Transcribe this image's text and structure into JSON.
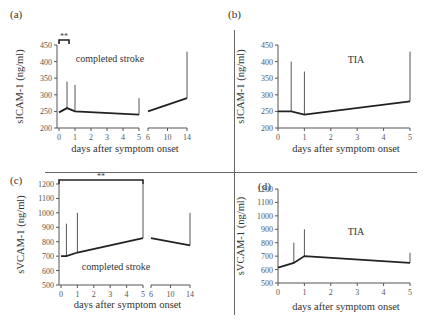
{
  "figure": {
    "panels": [
      "a",
      "b",
      "c",
      "d"
    ],
    "divider_color": "#666666",
    "line_color": "#222222",
    "axis_color": "#555555"
  },
  "chart_data": [
    {
      "panel": "(a)",
      "type": "line",
      "title": "",
      "annotation": "completed stroke",
      "significance_marker": "**",
      "significance_span": [
        0,
        0.5
      ],
      "xlabel": "days after symptom onset",
      "ylabel": "sICAM-1 (ng/ml)",
      "ylim": [
        200,
        450
      ],
      "yticks": [
        200,
        250,
        300,
        350,
        400,
        450
      ],
      "x_segments": [
        {
          "xticks": [
            0,
            1,
            2,
            3,
            4,
            5
          ],
          "range": [
            0,
            5
          ]
        },
        {
          "xticks": [
            6,
            10,
            14
          ],
          "range": [
            6,
            14
          ]
        }
      ],
      "xtick_labels": [
        "0",
        "1",
        "2",
        "3",
        "4",
        "5",
        "6",
        "10",
        "14"
      ],
      "series": [
        {
          "name": "mean",
          "x": [
            0,
            0.5,
            1,
            5
          ],
          "values": [
            247,
            260,
            250,
            240
          ]
        },
        {
          "name": "mean (late)",
          "x": [
            6,
            14
          ],
          "values": [
            250,
            290
          ]
        }
      ],
      "error_bars": [
        {
          "x": 0.5,
          "mean": 260,
          "upper": 340
        },
        {
          "x": 1,
          "mean": 250,
          "upper": 330
        },
        {
          "x": 5,
          "mean": 240,
          "upper": 290
        },
        {
          "x": 14,
          "mean": 290,
          "upper": 430
        }
      ],
      "grid": false
    },
    {
      "panel": "(b)",
      "type": "line",
      "annotation": "TIA",
      "xlabel": "days after symptom onset",
      "ylabel": "sICAM-1 (ng/ml)",
      "ylim": [
        200,
        450
      ],
      "yticks": [
        200,
        250,
        300,
        350,
        400,
        450
      ],
      "xlim": [
        0,
        5
      ],
      "xtick_labels": [
        "0",
        "1",
        "2",
        "3",
        "4",
        "5"
      ],
      "series": [
        {
          "name": "mean",
          "x": [
            0,
            0.5,
            1,
            5
          ],
          "values": [
            250,
            250,
            240,
            280
          ]
        }
      ],
      "error_bars": [
        {
          "x": 0.5,
          "mean": 250,
          "upper": 400
        },
        {
          "x": 1,
          "mean": 240,
          "upper": 370
        },
        {
          "x": 5,
          "mean": 280,
          "upper": 430
        }
      ],
      "grid": false
    },
    {
      "panel": "(c)",
      "type": "line",
      "annotation": "completed stroke",
      "significance_marker": "**",
      "significance_span": [
        0,
        5
      ],
      "xlabel": "days after symptom onset",
      "ylabel": "sVCAM-1 (ng/ml)",
      "ylim": [
        500,
        1200
      ],
      "yticks": [
        500,
        600,
        700,
        800,
        900,
        1000,
        1100,
        1200
      ],
      "x_segments": [
        {
          "xticks": [
            0,
            1,
            2,
            3,
            4,
            5
          ],
          "range": [
            0,
            5
          ]
        },
        {
          "xticks": [
            6,
            10,
            14
          ],
          "range": [
            6,
            14
          ]
        }
      ],
      "xtick_labels": [
        "0",
        "1",
        "2",
        "3",
        "4",
        "5",
        "6",
        "10",
        "14"
      ],
      "series": [
        {
          "name": "mean",
          "x": [
            0,
            0.33,
            1,
            5
          ],
          "values": [
            700,
            700,
            725,
            825
          ]
        },
        {
          "name": "mean (late)",
          "x": [
            6,
            14
          ],
          "values": [
            825,
            775
          ]
        }
      ],
      "error_bars": [
        {
          "x": 0.33,
          "mean": 700,
          "upper": 925
        },
        {
          "x": 1,
          "mean": 725,
          "upper": 1000
        },
        {
          "x": 5,
          "mean": 825,
          "upper": 1200
        },
        {
          "x": 14,
          "mean": 775,
          "upper": 1000
        }
      ],
      "grid": false
    },
    {
      "panel": "(d)",
      "type": "line",
      "annotation": "TIA",
      "xlabel": "days after symptom onset",
      "ylabel": "sVCAM-1 (ng/ml)",
      "ylim": [
        500,
        1200
      ],
      "yticks": [
        500,
        600,
        700,
        800,
        900,
        1000,
        1100,
        1200
      ],
      "xlim": [
        0,
        5
      ],
      "xtick_labels": [
        "0",
        "1",
        "2",
        "3",
        "4",
        "5"
      ],
      "series": [
        {
          "name": "mean",
          "x": [
            0,
            0.6,
            1,
            5
          ],
          "values": [
            615,
            650,
            700,
            650
          ]
        }
      ],
      "error_bars": [
        {
          "x": 0.6,
          "mean": 650,
          "upper": 800
        },
        {
          "x": 1,
          "mean": 700,
          "upper": 900
        },
        {
          "x": 5,
          "mean": 650,
          "upper": 725
        }
      ],
      "grid": false
    }
  ]
}
